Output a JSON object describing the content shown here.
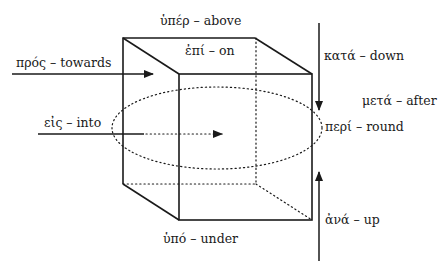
{
  "diagram": {
    "type": "greek-prepositions-cube",
    "colors": {
      "line": "#1a1a1a",
      "background": "#ffffff"
    },
    "labels": {
      "above": "ὑπέρ – above",
      "on": "ἐπί – on",
      "towards": "πρός – towards",
      "down": "κατά – down",
      "after": "μετά – after",
      "into": "εἰς – into",
      "round": "περί – round",
      "under": "ὑπό – under",
      "up": "ἀνά – up"
    }
  }
}
